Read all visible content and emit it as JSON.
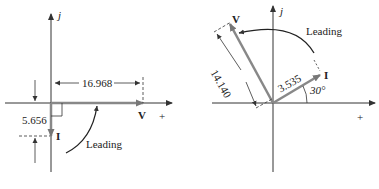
{
  "left_diagram": {
    "axis_imag_label": "j",
    "axis_real_plus_label": "+",
    "voltage_label": "V",
    "current_label": "I",
    "voltage_magnitude": "16.968",
    "current_magnitude": "5.656",
    "annotation": "Leading"
  },
  "right_diagram": {
    "axis_imag_label": "j",
    "axis_real_plus_label": "+",
    "voltage_label": "V",
    "current_label": "I",
    "voltage_magnitude": "14.140",
    "current_magnitude": "3.535",
    "angle_label": "30°",
    "annotation": "Leading"
  },
  "colors": {
    "axis": "#333333",
    "phasor": "#8a8a8a",
    "text": "#222222"
  }
}
